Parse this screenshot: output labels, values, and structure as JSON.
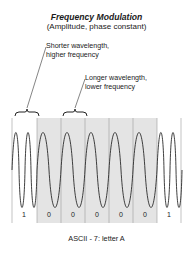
{
  "title": "Frequency Modulation",
  "subtitle": "(Amplitude, phase constant)",
  "annotations": {
    "short": {
      "line1": "Shorter wavelength,",
      "line2": "higher frequency"
    },
    "long": {
      "line1": "Longer wavelength,",
      "line2": "lower frequency"
    }
  },
  "bits": [
    "1",
    "0",
    "0",
    "0",
    "0",
    "0",
    "1"
  ],
  "caption": "ASCII - 7:  letter A",
  "colors": {
    "shade": "#e4e4e4",
    "line": "#333333",
    "grid": "#9a9a9a"
  }
}
